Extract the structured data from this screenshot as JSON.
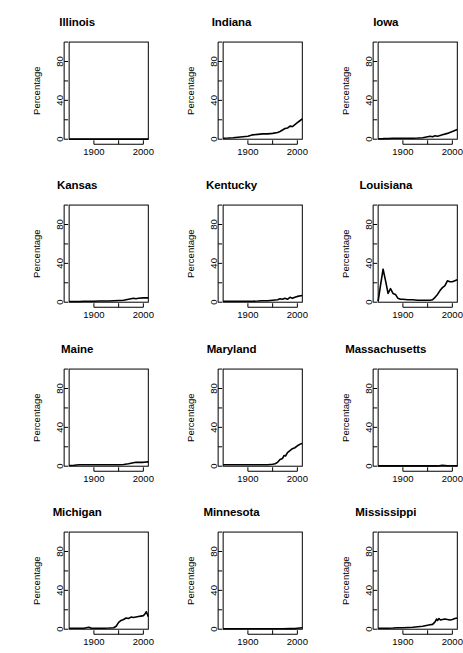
{
  "figure": {
    "layout": {
      "rows": 4,
      "cols": 3,
      "panels": 12
    },
    "axis": {
      "ylabel": "Percentage",
      "xlabel": "",
      "y_tick_labels": [
        "0",
        "40",
        "80"
      ],
      "y_tick_values": [
        0,
        40,
        80
      ],
      "y_minor_tick_values": [
        20,
        60,
        100
      ],
      "x_tick_labels": [
        "1900",
        "",
        "2000"
      ],
      "x_tick_values": [
        1900,
        1950,
        2000
      ],
      "ylim": [
        0,
        100
      ],
      "xlim": [
        1850,
        2010
      ],
      "grid": false,
      "legend": "none"
    },
    "style": {
      "line_color": "#000000",
      "background": "#ffffff",
      "axis_color": "#000000"
    }
  },
  "chart_data": [
    {
      "type": "line",
      "title": "Illinois",
      "xlabel": "",
      "ylabel": "Percentage",
      "xlim": [
        1850,
        2010
      ],
      "ylim": [
        0,
        100
      ],
      "x": [
        1850,
        1860,
        1870,
        1880,
        1890,
        1900,
        1910,
        1920,
        1930,
        1940,
        1950,
        1960,
        1970,
        1980,
        1990,
        2000,
        2010
      ],
      "values": [
        0.1,
        0.1,
        0.1,
        0.1,
        0.1,
        0.1,
        0.1,
        0.1,
        0.1,
        0.1,
        0.1,
        0.1,
        0.1,
        0.1,
        0.1,
        0.1,
        0.1
      ]
    },
    {
      "type": "line",
      "title": "Indiana",
      "xlabel": "",
      "ylabel": "Percentage",
      "xlim": [
        1850,
        2010
      ],
      "ylim": [
        0,
        100
      ],
      "x": [
        1850,
        1860,
        1870,
        1880,
        1890,
        1900,
        1910,
        1920,
        1930,
        1940,
        1950,
        1960,
        1965,
        1970,
        1975,
        1980,
        1985,
        1990,
        1995,
        2000,
        2005,
        2010
      ],
      "values": [
        1.0,
        1.2,
        1.5,
        2.0,
        2.5,
        3.0,
        4.5,
        5.0,
        5.5,
        5.5,
        6.0,
        7.0,
        8.0,
        9.5,
        11.0,
        11.5,
        13.5,
        13.0,
        15.0,
        17.0,
        19.0,
        21.0
      ]
    },
    {
      "type": "line",
      "title": "Iowa",
      "xlabel": "",
      "ylabel": "Percentage",
      "xlim": [
        1850,
        2010
      ],
      "ylim": [
        0,
        100
      ],
      "x": [
        1850,
        1860,
        1870,
        1880,
        1890,
        1900,
        1910,
        1920,
        1930,
        1940,
        1950,
        1955,
        1960,
        1965,
        1970,
        1980,
        1990,
        2000,
        2010
      ],
      "values": [
        0.5,
        0.6,
        0.8,
        1.0,
        1.0,
        1.0,
        1.0,
        1.0,
        1.2,
        1.5,
        2.5,
        3.0,
        2.5,
        3.5,
        3.0,
        4.5,
        6.0,
        8.0,
        10.0
      ]
    },
    {
      "type": "line",
      "title": "Kansas",
      "xlabel": "",
      "ylabel": "Percentage",
      "xlim": [
        1850,
        2010
      ],
      "ylim": [
        0,
        100
      ],
      "x": [
        1850,
        1870,
        1880,
        1890,
        1900,
        1910,
        1920,
        1930,
        1940,
        1950,
        1960,
        1970,
        1975,
        1980,
        1985,
        1990,
        2000,
        2010
      ],
      "values": [
        0.8,
        0.8,
        1.0,
        1.0,
        1.0,
        1.2,
        1.2,
        1.2,
        1.5,
        1.8,
        2.0,
        3.0,
        3.5,
        4.0,
        3.5,
        4.0,
        4.5,
        4.5
      ]
    },
    {
      "type": "line",
      "title": "Kentucky",
      "xlabel": "",
      "ylabel": "Percentage",
      "xlim": [
        1850,
        2010
      ],
      "ylim": [
        0,
        100
      ],
      "x": [
        1850,
        1870,
        1890,
        1900,
        1910,
        1920,
        1930,
        1940,
        1950,
        1960,
        1965,
        1970,
        1975,
        1980,
        1985,
        1990,
        1995,
        2000,
        2010
      ],
      "values": [
        1.0,
        1.0,
        1.0,
        1.0,
        1.0,
        1.2,
        1.5,
        1.5,
        2.0,
        2.5,
        3.5,
        3.0,
        4.0,
        3.0,
        5.0,
        4.0,
        5.0,
        6.0,
        7.0
      ]
    },
    {
      "type": "line",
      "title": "Louisiana",
      "xlabel": "",
      "ylabel": "Percentage",
      "xlim": [
        1850,
        2010
      ],
      "ylim": [
        0,
        100
      ],
      "x": [
        1850,
        1855,
        1860,
        1865,
        1870,
        1875,
        1880,
        1885,
        1890,
        1895,
        1900,
        1910,
        1920,
        1930,
        1940,
        1950,
        1955,
        1960,
        1965,
        1970,
        1975,
        1980,
        1985,
        1990,
        1995,
        2000,
        2005,
        2010
      ],
      "values": [
        1.0,
        18.0,
        34.0,
        22.0,
        9.0,
        14.0,
        9.0,
        8.0,
        4.0,
        3.0,
        3.0,
        2.5,
        2.5,
        2.0,
        2.0,
        2.0,
        2.0,
        2.5,
        5.0,
        8.0,
        12.0,
        15.0,
        17.0,
        22.0,
        21.0,
        21.0,
        22.0,
        23.0
      ]
    },
    {
      "type": "line",
      "title": "Maine",
      "xlabel": "",
      "ylabel": "Percentage",
      "xlim": [
        1850,
        2010
      ],
      "ylim": [
        0,
        100
      ],
      "x": [
        1850,
        1860,
        1870,
        1880,
        1890,
        1900,
        1910,
        1920,
        1930,
        1940,
        1950,
        1960,
        1970,
        1975,
        1980,
        1985,
        1990,
        2000,
        2010
      ],
      "values": [
        0.8,
        1.0,
        1.5,
        1.5,
        1.5,
        1.5,
        1.5,
        1.5,
        1.5,
        1.5,
        1.5,
        1.8,
        2.5,
        3.0,
        3.5,
        4.0,
        4.0,
        4.0,
        4.5
      ]
    },
    {
      "type": "line",
      "title": "Maryland",
      "xlabel": "",
      "ylabel": "Percentage",
      "xlim": [
        1850,
        2010
      ],
      "ylim": [
        0,
        100
      ],
      "x": [
        1850,
        1870,
        1890,
        1900,
        1910,
        1920,
        1930,
        1940,
        1950,
        1955,
        1960,
        1965,
        1970,
        1973,
        1976,
        1980,
        1985,
        1990,
        1995,
        2000,
        2005,
        2010
      ],
      "values": [
        1.5,
        1.5,
        1.5,
        1.5,
        1.5,
        1.5,
        1.5,
        1.5,
        2.0,
        2.5,
        4.0,
        7.0,
        8.0,
        11.0,
        10.5,
        14.0,
        16.0,
        18.0,
        19.0,
        21.0,
        22.5,
        23.5
      ]
    },
    {
      "type": "line",
      "title": "Massachusetts",
      "xlabel": "",
      "ylabel": "Percentage",
      "xlim": [
        1850,
        2010
      ],
      "ylim": [
        0,
        100
      ],
      "x": [
        1850,
        1870,
        1890,
        1910,
        1930,
        1950,
        1970,
        1980,
        1990,
        2000,
        2010
      ],
      "values": [
        0.3,
        0.3,
        0.3,
        0.3,
        0.3,
        0.3,
        0.3,
        1.0,
        0.5,
        0.5,
        0.5
      ]
    },
    {
      "type": "line",
      "title": "Michigan",
      "xlabel": "",
      "ylabel": "Percentage",
      "xlim": [
        1850,
        2010
      ],
      "ylim": [
        0,
        100
      ],
      "x": [
        1850,
        1870,
        1880,
        1890,
        1895,
        1900,
        1910,
        1920,
        1930,
        1940,
        1945,
        1950,
        1955,
        1960,
        1965,
        1970,
        1975,
        1980,
        1985,
        1990,
        1995,
        2000,
        2003,
        2006,
        2010
      ],
      "values": [
        1.0,
        1.0,
        1.0,
        2.0,
        1.0,
        1.0,
        1.0,
        1.0,
        1.2,
        1.5,
        3.0,
        7.0,
        9.0,
        10.0,
        11.5,
        11.0,
        12.5,
        12.0,
        12.5,
        13.0,
        13.5,
        14.0,
        15.5,
        18.0,
        13.0
      ]
    },
    {
      "type": "line",
      "title": "Minnesota",
      "xlabel": "",
      "ylabel": "Percentage",
      "xlim": [
        1850,
        2010
      ],
      "ylim": [
        0,
        100
      ],
      "x": [
        1850,
        1870,
        1890,
        1910,
        1930,
        1950,
        1970,
        1985,
        1995,
        2000,
        2010
      ],
      "values": [
        0.4,
        0.4,
        0.4,
        0.4,
        0.4,
        0.4,
        0.4,
        0.8,
        0.6,
        1.0,
        1.5
      ]
    },
    {
      "type": "line",
      "title": "Mississippi",
      "xlabel": "",
      "ylabel": "Percentage",
      "xlim": [
        1850,
        2010
      ],
      "ylim": [
        0,
        100
      ],
      "x": [
        1850,
        1870,
        1880,
        1890,
        1900,
        1910,
        1920,
        1930,
        1940,
        1950,
        1955,
        1960,
        1965,
        1968,
        1970,
        1973,
        1976,
        1980,
        1985,
        1990,
        1995,
        2000,
        2005,
        2010
      ],
      "values": [
        1.0,
        1.0,
        1.2,
        1.5,
        1.5,
        1.8,
        2.0,
        2.5,
        3.0,
        4.0,
        4.5,
        5.0,
        7.5,
        10.5,
        9.0,
        11.0,
        9.5,
        10.0,
        10.5,
        10.0,
        9.5,
        10.0,
        11.0,
        11.5
      ]
    }
  ]
}
